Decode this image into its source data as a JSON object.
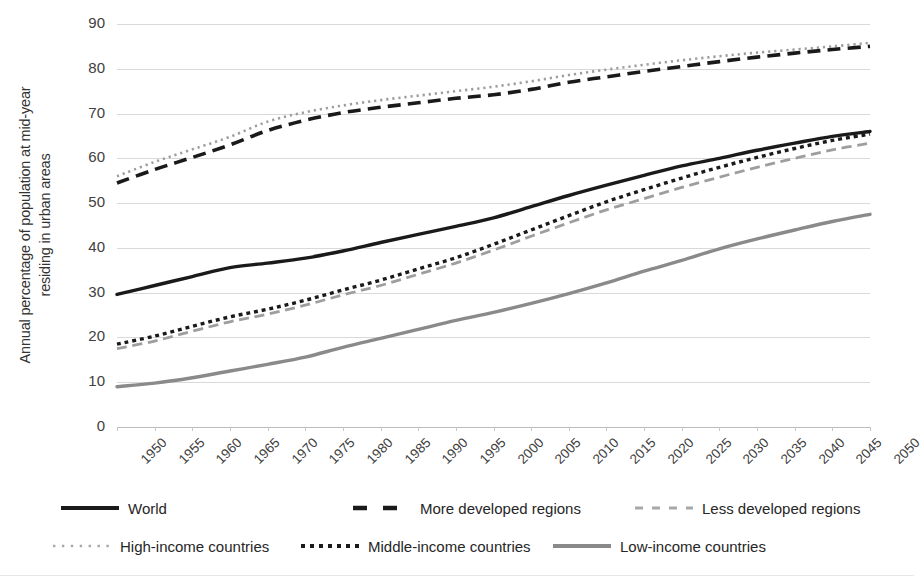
{
  "chart_data": {
    "type": "line",
    "title": "",
    "xlabel": "",
    "ylabel": "Annual percentage of population at mid-year residing in urban areas",
    "ylabel_line1": "Annual percentage  of population at mid-year",
    "ylabel_line2": "residing in urban areas",
    "xlim": [
      1950,
      2050
    ],
    "ylim": [
      0,
      90
    ],
    "ytick_values": [
      0,
      10,
      20,
      30,
      40,
      50,
      60,
      70,
      80,
      90
    ],
    "ytick_labels": [
      "0",
      "10",
      "20",
      "30",
      "40",
      "50",
      "60",
      "70",
      "80",
      "90"
    ],
    "grid": true,
    "legend_position": "bottom",
    "categories": [
      1950,
      1955,
      1960,
      1965,
      1970,
      1975,
      1980,
      1985,
      1990,
      1995,
      2000,
      2005,
      2010,
      2015,
      2020,
      2025,
      2030,
      2035,
      2040,
      2045,
      2050
    ],
    "xtick_labels": [
      "1950",
      "1955",
      "1960",
      "1965",
      "1970",
      "1975",
      "1980",
      "1985",
      "1990",
      "1995",
      "2000",
      "2005",
      "2010",
      "2015",
      "2020",
      "2025",
      "2030",
      "2035",
      "2040",
      "2045",
      "2050"
    ],
    "series": [
      {
        "name": "World",
        "color": "#1a1a1a",
        "style": "solid",
        "width": 3.4,
        "values": [
          29.6,
          31.6,
          33.6,
          35.6,
          36.6,
          37.7,
          39.3,
          41.2,
          43.0,
          44.8,
          46.7,
          49.2,
          51.7,
          54.0,
          56.2,
          58.3,
          60.0,
          61.8,
          63.4,
          64.9,
          66.0
        ]
      },
      {
        "name": "More developed regions",
        "color": "#1a1a1a",
        "style": "dashed",
        "width": 3.6,
        "values": [
          54.5,
          57.5,
          60.2,
          63.0,
          66.2,
          68.5,
          70.2,
          71.4,
          72.4,
          73.4,
          74.2,
          75.4,
          77.0,
          78.2,
          79.4,
          80.5,
          81.6,
          82.6,
          83.5,
          84.3,
          85.0
        ]
      },
      {
        "name": "Less developed regions",
        "color": "#9e9e9e",
        "style": "dashed",
        "width": 2.8,
        "values": [
          17.5,
          19.2,
          21.4,
          23.5,
          25.2,
          27.2,
          29.5,
          31.6,
          34.1,
          36.6,
          39.5,
          42.6,
          45.6,
          48.5,
          51.0,
          53.5,
          55.8,
          58.0,
          60.0,
          61.9,
          63.4
        ]
      },
      {
        "name": "High-income countries",
        "color": "#9e9e9e",
        "style": "dotted-fine",
        "width": 2.6,
        "values": [
          56.0,
          59.2,
          62.0,
          64.8,
          68.2,
          70.3,
          71.8,
          73.0,
          74.0,
          75.0,
          76.0,
          77.2,
          78.6,
          79.8,
          80.9,
          81.9,
          82.8,
          83.6,
          84.3,
          85.0,
          85.8
        ]
      },
      {
        "name": "Middle-income countries",
        "color": "#1a1a1a",
        "style": "dotted",
        "width": 3.4,
        "values": [
          18.5,
          20.3,
          22.5,
          24.6,
          26.3,
          28.3,
          30.6,
          32.8,
          35.3,
          37.8,
          40.8,
          44.0,
          47.2,
          50.3,
          53.0,
          55.6,
          58.0,
          60.2,
          62.2,
          64.0,
          65.4
        ]
      },
      {
        "name": "Low-income countries",
        "color": "#8a8a8a",
        "style": "solid",
        "width": 3.4,
        "values": [
          9.0,
          9.8,
          11.0,
          12.5,
          14.0,
          15.6,
          17.8,
          19.8,
          21.8,
          23.8,
          25.6,
          27.6,
          29.8,
          32.2,
          34.8,
          37.2,
          39.8,
          42.0,
          44.0,
          45.9,
          47.5
        ]
      }
    ]
  },
  "legend": {
    "rows": [
      [
        {
          "label": "World",
          "swatch": "solid-black"
        },
        {
          "label": "More developed regions",
          "swatch": "dashed-black"
        },
        {
          "label": "Less developed regions",
          "swatch": "dashed-gray"
        }
      ],
      [
        {
          "label": "High-income countries",
          "swatch": "dotted-fine-gray"
        },
        {
          "label": "Middle-income countries",
          "swatch": "dotted-black"
        },
        {
          "label": "Low-income countries",
          "swatch": "solid-gray"
        }
      ]
    ]
  }
}
